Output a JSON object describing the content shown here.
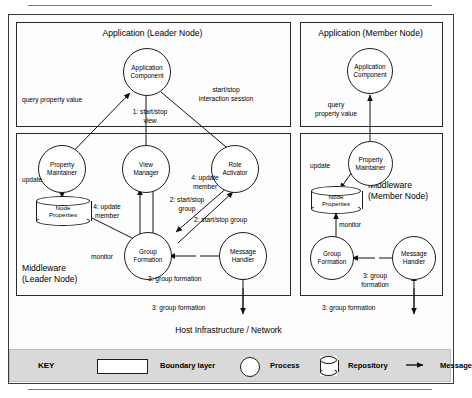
{
  "figure": {
    "host_layer_label": "Host Infrastructure / Network"
  },
  "leader": {
    "application_box_title": "Application (Leader Node)",
    "middleware_box_title_line1": "Middleware",
    "middleware_box_title_line2": "(Leader Node)",
    "app_component": "Application\nComponent",
    "property_maintainer": "Property\nMaintainer",
    "view_manager": "View\nManager",
    "role_activator": "Role\nActivator",
    "group_formation": "Group\nFormation",
    "message_handler": "Message\nHandler",
    "node_properties": "Node\nProperties",
    "labels": {
      "query_property_value": "query property value",
      "start_stop_interaction_line1": "start/stop",
      "start_stop_interaction_line2": "interaction session",
      "start_stop_view_line1": "1: start/stop",
      "start_stop_view_line2": "view",
      "update": "update",
      "update_member_vm_line1": "4: update",
      "update_member_vm_line2": "member",
      "start_stop_group_vm_line1": "2: start/stop",
      "start_stop_group_vm_line2": "group",
      "update_member_ra_line1": "4: update",
      "update_member_ra_line2": "member",
      "start_stop_group_ra": "2: start/stop group",
      "monitor": "monitor",
      "group_formation_msg": "3: group formation",
      "group_formation_net": "3: group formation"
    }
  },
  "member": {
    "application_box_title": "Application (Member Node)",
    "middleware_box_title_line1": "Middleware",
    "middleware_box_title_line2": "(Member Node)",
    "app_component": "Application\nComponent",
    "property_maintainer": "Property\nMaintainer",
    "group_formation": "Group\nFormation",
    "message_handler": "Message\nHandler",
    "node_properties": "Node\nProperties",
    "labels": {
      "query_line1": "query",
      "query_line2": "property value",
      "update": "update",
      "monitor": "monitor",
      "group_formation_msg_line1": "3: group",
      "group_formation_msg_line2": "formation",
      "group_formation_net": "3: group formation"
    }
  },
  "key": {
    "title": "KEY",
    "boundary_layer": "Boundary layer",
    "process": "Process",
    "repository": "Repository",
    "message": "Message"
  },
  "colors": {
    "stroke": "#1d1d1d",
    "box_stroke": "#2b2b2b",
    "frame": "#3a3a3a",
    "key_bg": "#d9d9d9",
    "rule": "#7a7a7a"
  }
}
